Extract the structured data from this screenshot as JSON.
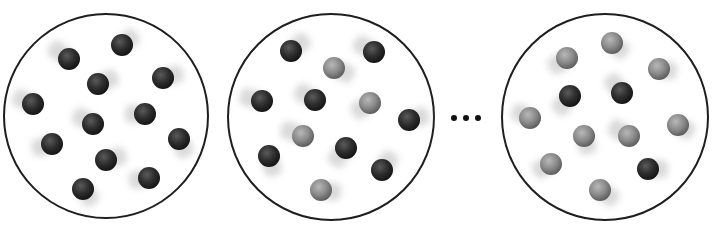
{
  "diagram": {
    "ball_radius": 11,
    "colors": {
      "dark_ball": "#2b2b2b",
      "light_ball": "#8a8a8a",
      "container_stroke": "#1e1e1e",
      "trail": "#d4d4d4",
      "dots": "#111111"
    },
    "containers": [
      {
        "id": "container-1",
        "cx": 106,
        "cy": 116,
        "r": 102,
        "dark_count": 12,
        "light_count": 0,
        "balls": [
          {
            "x": 69,
            "y": 59,
            "type": "dark",
            "trail": [
              -14,
              -10
            ]
          },
          {
            "x": 122,
            "y": 45,
            "type": "dark",
            "trail": [
              10,
              -8
            ]
          },
          {
            "x": 98,
            "y": 84,
            "type": "dark",
            "trail": [
              14,
              -6
            ]
          },
          {
            "x": 163,
            "y": 78,
            "type": "dark",
            "trail": [
              14,
              -4
            ]
          },
          {
            "x": 33,
            "y": 104,
            "type": "dark",
            "trail": [
              -14,
              -6
            ]
          },
          {
            "x": 93,
            "y": 124,
            "type": "dark",
            "trail": [
              -14,
              -8
            ]
          },
          {
            "x": 145,
            "y": 114,
            "type": "dark",
            "trail": [
              -14,
              0
            ]
          },
          {
            "x": 52,
            "y": 144,
            "type": "dark",
            "trail": [
              -14,
              4
            ]
          },
          {
            "x": 179,
            "y": 139,
            "type": "dark",
            "trail": [
              6,
              12
            ]
          },
          {
            "x": 106,
            "y": 160,
            "type": "dark",
            "trail": [
              14,
              -4
            ]
          },
          {
            "x": 149,
            "y": 178,
            "type": "dark",
            "trail": [
              -14,
              2
            ]
          },
          {
            "x": 83,
            "y": 189,
            "type": "dark",
            "trail": [
              8,
              10
            ]
          }
        ]
      },
      {
        "id": "container-2",
        "cx": 331,
        "cy": 117,
        "r": 103,
        "dark_count": 8,
        "light_count": 4,
        "balls": [
          {
            "x": 291,
            "y": 51,
            "type": "dark",
            "trail": [
              12,
              -10
            ]
          },
          {
            "x": 374,
            "y": 52,
            "type": "dark",
            "trail": [
              -14,
              -8
            ]
          },
          {
            "x": 334,
            "y": 68,
            "type": "light",
            "trail": [
              14,
              6
            ]
          },
          {
            "x": 262,
            "y": 101,
            "type": "dark",
            "trail": [
              -16,
              -4
            ]
          },
          {
            "x": 315,
            "y": 100,
            "type": "dark",
            "trail": [
              -14,
              -8
            ]
          },
          {
            "x": 370,
            "y": 103,
            "type": "light",
            "trail": [
              -12,
              8
            ]
          },
          {
            "x": 409,
            "y": 120,
            "type": "dark",
            "trail": [
              14,
              -4
            ]
          },
          {
            "x": 303,
            "y": 136,
            "type": "light",
            "trail": [
              -16,
              -6
            ]
          },
          {
            "x": 346,
            "y": 148,
            "type": "dark",
            "trail": [
              -10,
              12
            ]
          },
          {
            "x": 269,
            "y": 156,
            "type": "dark",
            "trail": [
              4,
              14
            ]
          },
          {
            "x": 382,
            "y": 170,
            "type": "dark",
            "trail": [
              8,
              -12
            ]
          },
          {
            "x": 321,
            "y": 190,
            "type": "light",
            "trail": [
              14,
              2
            ]
          }
        ]
      },
      {
        "id": "container-3",
        "cx": 605,
        "cy": 117,
        "r": 103,
        "dark_count": 3,
        "light_count": 9,
        "balls": [
          {
            "x": 567,
            "y": 58,
            "type": "light",
            "trail": [
              -12,
              8
            ]
          },
          {
            "x": 612,
            "y": 43,
            "type": "light",
            "trail": [
              10,
              8
            ]
          },
          {
            "x": 659,
            "y": 69,
            "type": "light",
            "trail": [
              12,
              2
            ]
          },
          {
            "x": 570,
            "y": 96,
            "type": "dark",
            "trail": [
              -10,
              12
            ]
          },
          {
            "x": 622,
            "y": 93,
            "type": "dark",
            "trail": [
              -10,
              -12
            ]
          },
          {
            "x": 530,
            "y": 118,
            "type": "light",
            "trail": [
              -12,
              -6
            ]
          },
          {
            "x": 584,
            "y": 136,
            "type": "light",
            "trail": [
              4,
              12
            ]
          },
          {
            "x": 629,
            "y": 136,
            "type": "light",
            "trail": [
              -14,
              -8
            ]
          },
          {
            "x": 678,
            "y": 125,
            "type": "light",
            "trail": [
              10,
              6
            ]
          },
          {
            "x": 551,
            "y": 164,
            "type": "light",
            "trail": [
              -12,
              6
            ]
          },
          {
            "x": 648,
            "y": 169,
            "type": "dark",
            "trail": [
              14,
              0
            ]
          },
          {
            "x": 600,
            "y": 190,
            "type": "light",
            "trail": [
              12,
              8
            ]
          }
        ]
      }
    ],
    "ellipsis": {
      "symbol": "•••",
      "dots": [
        {
          "x": 454,
          "y": 118
        },
        {
          "x": 466,
          "y": 118
        },
        {
          "x": 478,
          "y": 118
        }
      ],
      "dot_radius": 3
    }
  }
}
